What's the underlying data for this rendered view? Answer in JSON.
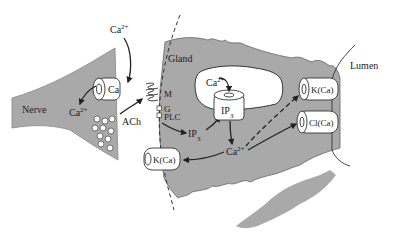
{
  "diagram": {
    "type": "biological-signaling-schematic",
    "regions": {
      "nerve": "Nerve",
      "gland": "Gland",
      "lumen": "Lumen"
    },
    "labels": {
      "ca_extracellular": "Ca",
      "ca_extracellular_sup": "2+",
      "ca_channel": "Ca",
      "ca_nerve": "Ca",
      "ca_nerve_sup": "2+",
      "ach": "ACh",
      "receptor_m": "M",
      "g_protein": "G",
      "plc": "PLC",
      "ip3_messenger": "IP",
      "ip3_messenger_sub": "3",
      "ip3_receptor": "IP",
      "ip3_receptor_sub": "3",
      "ca_store": "Ca",
      "ca_store_sup": "2+",
      "ca_cytosol": "Ca",
      "ca_cytosol_sup": "2+",
      "k_ca_basolateral": "K(Ca)",
      "k_ca_apical": "K(Ca)",
      "cl_ca_apical": "Cl(Ca)"
    },
    "colors": {
      "cell_fill": "#a9a9a9",
      "outline": "#333333",
      "background": "#ffffff",
      "channel_fill": "#ffffff"
    }
  }
}
